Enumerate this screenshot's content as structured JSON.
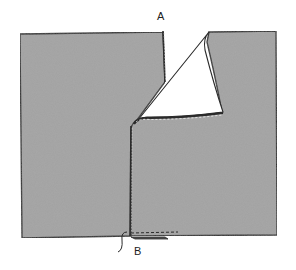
{
  "diagram": {
    "type": "sewing-illustration",
    "labels": {
      "a": "A",
      "b": "B"
    },
    "colors": {
      "fabric": "#a3a3a3",
      "outline": "#2a2a2a",
      "flap": "#ffffff",
      "background": "#ffffff"
    }
  }
}
